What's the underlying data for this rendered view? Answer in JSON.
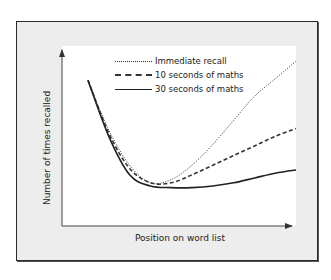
{
  "chart_data": {
    "type": "line",
    "title": "",
    "xlabel": "Position on word list",
    "ylabel": "Number of times recalled",
    "axis_ticks": false,
    "grid": false,
    "legend_position": "top-center",
    "x": [
      0,
      0.1,
      0.2,
      0.3,
      0.4,
      0.5,
      0.6,
      0.7,
      0.8,
      0.9,
      1.0
    ],
    "series": [
      {
        "name": "Immediate recall",
        "style": "dotted",
        "color": "#333333",
        "values": [
          0.86,
          0.55,
          0.33,
          0.22,
          0.24,
          0.33,
          0.46,
          0.61,
          0.76,
          0.87,
          0.98
        ]
      },
      {
        "name": "10 seconds of maths",
        "style": "dashed",
        "color": "#333333",
        "values": [
          0.86,
          0.53,
          0.31,
          0.22,
          0.22,
          0.27,
          0.33,
          0.39,
          0.45,
          0.51,
          0.56
        ]
      },
      {
        "name": "30 seconds of maths",
        "style": "solid",
        "color": "#222222",
        "values": [
          0.86,
          0.51,
          0.27,
          0.2,
          0.19,
          0.19,
          0.2,
          0.22,
          0.25,
          0.28,
          0.3
        ]
      }
    ],
    "ylim": [
      0,
      1
    ],
    "xlim": [
      0,
      1
    ]
  },
  "legend": [
    {
      "label": "Immediate recall",
      "style": "dotted"
    },
    {
      "label": "10 seconds of maths",
      "style": "dashed"
    },
    {
      "label": "30 seconds of maths",
      "style": "solid"
    }
  ],
  "colors": {
    "frame_bg": "#ededed",
    "frame_border": "#2a2a2a",
    "plot_bg": "#ffffff",
    "line": "#222222"
  }
}
